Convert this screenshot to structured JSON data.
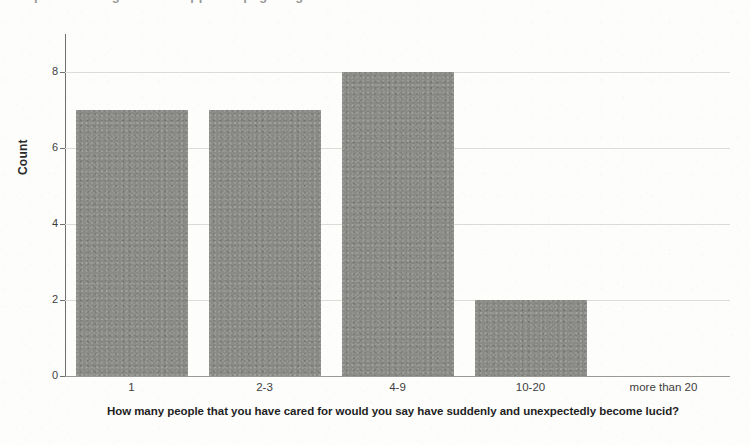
{
  "figure": {
    "background_color": "#fdfdfc",
    "clipped_title_fragment": "published figure title clipped at page edge"
  },
  "chart_data": {
    "type": "bar",
    "title": "",
    "categories": [
      "1",
      "2-3",
      "4-9",
      "10-20",
      "more than 20"
    ],
    "values": [
      7,
      7,
      8,
      2,
      0
    ],
    "xlabel": "How many people that you have cared for would you say have suddenly and unexpectedly become lucid?",
    "ylabel": "Count",
    "ylim": [
      0,
      9
    ],
    "yticks": [
      0,
      2,
      4,
      6,
      8
    ],
    "ytick_labels": [
      "0",
      "2",
      "4",
      "6",
      "8"
    ],
    "grid": true,
    "grid_axis": "y",
    "legend": false,
    "bar_color": "#8a8a87",
    "gridline_color": "#dcdcd6",
    "axis_color": "#6e6e6e"
  },
  "axes": {
    "y_title": "Count",
    "x_caption_line1": "How many people that you have cared for would you say have suddenly and unexpectedly become",
    "x_caption_line2": "lucid?"
  }
}
